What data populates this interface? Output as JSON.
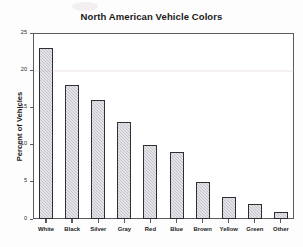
{
  "chart_data": {
    "type": "bar",
    "title": "North American Vehicle Colors",
    "xlabel": "",
    "ylabel": "Percent of Vehicles",
    "categories": [
      "White",
      "Black",
      "Silver",
      "Gray",
      "Red",
      "Blue",
      "Brown",
      "Yellow",
      "Green",
      "Other"
    ],
    "values": [
      23,
      18,
      16,
      13,
      10,
      9,
      5,
      3,
      2,
      1
    ],
    "ylim": [
      0,
      25
    ],
    "yticks": [
      0,
      5,
      10,
      15,
      20,
      25
    ],
    "ytick_labels": [
      "0",
      "5",
      "10",
      "15",
      "20",
      "25"
    ],
    "grid": false,
    "legend": false,
    "bar_fill_color": "#c3c4cb",
    "bar_edge_color": "#2e2e33",
    "frame_color": "#5a5a60"
  }
}
